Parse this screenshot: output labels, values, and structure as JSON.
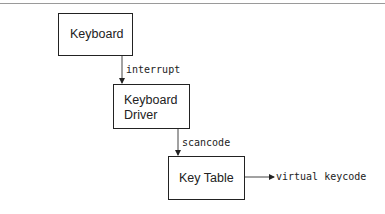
{
  "diagram": {
    "nodes": [
      {
        "id": "keyboard",
        "lines": [
          "Keyboard"
        ]
      },
      {
        "id": "keyboard-driver",
        "lines": [
          "Keyboard",
          "Driver"
        ]
      },
      {
        "id": "key-table",
        "lines": [
          "Key Table"
        ]
      }
    ],
    "edges": [
      {
        "from": "keyboard",
        "to": "keyboard-driver",
        "label": "interrupt"
      },
      {
        "from": "keyboard-driver",
        "to": "key-table",
        "label": "scancode"
      },
      {
        "from": "key-table",
        "to": "output",
        "label": "virtual keycode"
      }
    ]
  }
}
